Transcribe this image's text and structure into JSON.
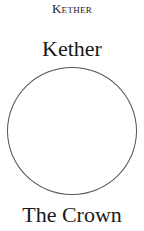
{
  "header": {
    "label": "Kether"
  },
  "sephirah": {
    "name": "Kether",
    "title": "The Crown",
    "shape": "circle",
    "stroke_color": "#555555",
    "fill_color": "#ffffff"
  }
}
